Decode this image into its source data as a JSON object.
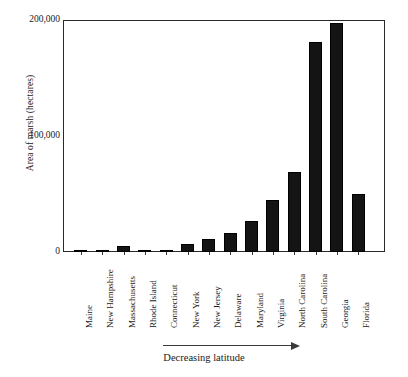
{
  "chart_data": {
    "type": "bar",
    "title": "",
    "subtitle": "",
    "xlabel": "Decreasing latitude",
    "ylabel": "Area of marsh (hectares)",
    "categories": [
      "Maine",
      "New Hampshire",
      "Massachusetts",
      "Rhode Island",
      "Connecticut",
      "New York",
      "New Jersey",
      "Delaware",
      "Maryland",
      "Virginia",
      "North Carolina",
      "South Carolina",
      "Georgia",
      "Florida"
    ],
    "values": [
      1500,
      1200,
      5000,
      1500,
      1500,
      7000,
      11000,
      16000,
      27000,
      45000,
      69000,
      181000,
      197000,
      50000
    ],
    "ylim": [
      0,
      200000
    ],
    "yticks": [
      0,
      100000,
      200000
    ],
    "ytick_labels": [
      "0",
      "100,000",
      "200,000"
    ],
    "grid": false,
    "legend": false,
    "legend_position": "none",
    "bar_color": "#141414",
    "axis_color": "#2a2a2a",
    "annotation": "Decreasing latitude"
  },
  "axes": {
    "y_title": "Area of marsh (hectares)",
    "x_title": "Decreasing latitude"
  },
  "ticks": {
    "y": [
      {
        "label": "200,000",
        "value": 200000
      },
      {
        "label": "100,000",
        "value": 100000
      },
      {
        "label": "0",
        "value": 0
      }
    ]
  }
}
